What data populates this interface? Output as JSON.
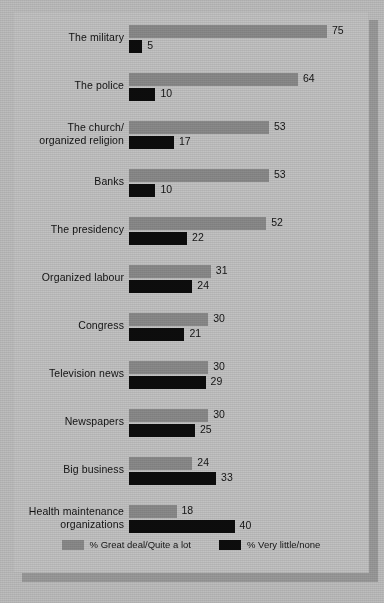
{
  "chart_data": {
    "type": "bar",
    "orientation": "horizontal",
    "title": "",
    "xlabel": "",
    "ylabel": "",
    "xlim": [
      0,
      75
    ],
    "grid": false,
    "legend_position": "bottom",
    "categories": [
      "The military",
      "The police",
      "The church/ organized religion",
      "Banks",
      "The presidency",
      "Organized labour",
      "Congress",
      "Television news",
      "Newspapers",
      "Big business",
      "Health maintenance organizations"
    ],
    "series": [
      {
        "name": "% Great deal/Quite a lot",
        "color": "#8a8a8a",
        "values": [
          75,
          64,
          53,
          53,
          52,
          31,
          30,
          30,
          30,
          24,
          18
        ]
      },
      {
        "name": "% Very little/none",
        "color": "#0d0d0d",
        "values": [
          5,
          10,
          17,
          10,
          22,
          24,
          21,
          29,
          25,
          33,
          40
        ]
      }
    ]
  },
  "rows": [
    {
      "label_line1": "The military",
      "label_line2": "",
      "top": 75,
      "bottom": 5
    },
    {
      "label_line1": "The police",
      "label_line2": "",
      "top": 64,
      "bottom": 10
    },
    {
      "label_line1": "The church/",
      "label_line2": "organized religion",
      "top": 53,
      "bottom": 17
    },
    {
      "label_line1": "Banks",
      "label_line2": "",
      "top": 53,
      "bottom": 10
    },
    {
      "label_line1": "The presidency",
      "label_line2": "",
      "top": 52,
      "bottom": 22
    },
    {
      "label_line1": "Organized labour",
      "label_line2": "",
      "top": 31,
      "bottom": 24
    },
    {
      "label_line1": "Congress",
      "label_line2": "",
      "top": 30,
      "bottom": 21
    },
    {
      "label_line1": "Television news",
      "label_line2": "",
      "top": 30,
      "bottom": 29
    },
    {
      "label_line1": "Newspapers",
      "label_line2": "",
      "top": 30,
      "bottom": 25
    },
    {
      "label_line1": "Big business",
      "label_line2": "",
      "top": 24,
      "bottom": 33
    },
    {
      "label_line1": "Health maintenance",
      "label_line2": "organizations",
      "top": 18,
      "bottom": 40
    }
  ],
  "legend": {
    "items": [
      {
        "label": "% Great deal/Quite a lot",
        "color": "#8a8a8a"
      },
      {
        "label": "% Very little/none",
        "color": "#0d0d0d"
      }
    ]
  },
  "scale": {
    "px_per_unit": 2.64,
    "row_pitch": 48,
    "first_row_top": 10
  }
}
